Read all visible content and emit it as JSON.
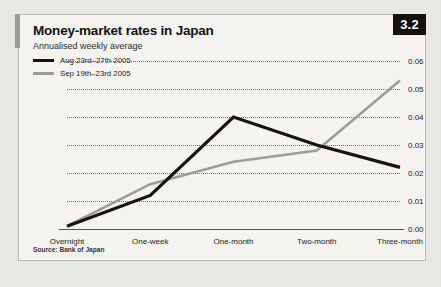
{
  "figure": {
    "badge": "3.2",
    "title": "Money-market rates in Japan",
    "subtitle": "Annualised weekly average",
    "source": "Source: Bank of Japan"
  },
  "chart_data": {
    "type": "line",
    "title": "Money-market rates in Japan",
    "subtitle": "Annualised weekly average",
    "xlabel": "",
    "ylabel": "",
    "ylim": [
      0.0,
      0.06
    ],
    "yticks": [
      0.0,
      0.01,
      0.02,
      0.03,
      0.04,
      0.05,
      0.06
    ],
    "ytick_labels": [
      "0.00",
      "0.01",
      "0.02",
      "0.03",
      "0.04",
      "0.05",
      "0.06"
    ],
    "grid": true,
    "grid_style": "dotted-horizontal",
    "legend_position": "top-left",
    "categories": [
      "Overnight",
      "One-week",
      "One-month",
      "Two-month",
      "Three-month"
    ],
    "series": [
      {
        "name": "Aug 23rd–27th 2005",
        "color": "#17130f",
        "values": [
          0.001,
          0.012,
          0.04,
          0.03,
          0.022
        ]
      },
      {
        "name": "Sep 19th–23rd 2005",
        "color": "#9d9c99",
        "values": [
          0.001,
          0.016,
          0.024,
          0.028,
          0.053
        ]
      }
    ]
  }
}
